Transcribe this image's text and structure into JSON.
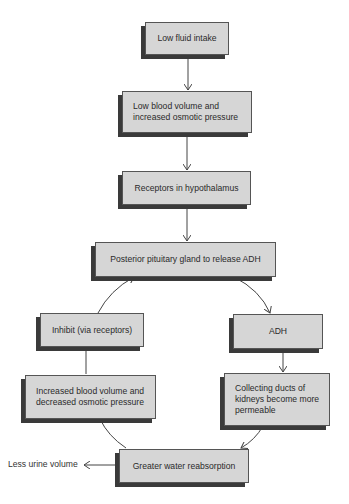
{
  "diagram": {
    "nodes": [
      {
        "id": "low-fluid-intake",
        "label": "Low fluid intake"
      },
      {
        "id": "low-blood-volume",
        "label": "Low blood volume and\nincreased osmotic pressure"
      },
      {
        "id": "receptors-hypothalamus",
        "label": "Receptors in hypothalamus"
      },
      {
        "id": "posterior-pituitary",
        "label": "Posterior pituitary gland to release ADH"
      },
      {
        "id": "inhibit",
        "label": "Inhibit (via receptors)"
      },
      {
        "id": "adh",
        "label": "ADH"
      },
      {
        "id": "increased-blood-volume",
        "label": "Increased blood volume and\ndecreased osmotic pressure"
      },
      {
        "id": "collecting-ducts",
        "label": "Collecting ducts of\nkidneys become more\npermeable"
      },
      {
        "id": "greater-water-reabsorption",
        "label": "Greater water reabsorption"
      }
    ],
    "outputs": {
      "less_urine": "Less urine volume"
    },
    "edges": [
      {
        "from": "low-fluid-intake",
        "to": "low-blood-volume"
      },
      {
        "from": "low-blood-volume",
        "to": "receptors-hypothalamus"
      },
      {
        "from": "receptors-hypothalamus",
        "to": "posterior-pituitary"
      },
      {
        "from": "posterior-pituitary",
        "to": "adh"
      },
      {
        "from": "adh",
        "to": "collecting-ducts"
      },
      {
        "from": "collecting-ducts",
        "to": "greater-water-reabsorption"
      },
      {
        "from": "greater-water-reabsorption",
        "to": "increased-blood-volume"
      },
      {
        "from": "increased-blood-volume",
        "to": "inhibit"
      },
      {
        "from": "inhibit",
        "to": "posterior-pituitary"
      },
      {
        "from": "greater-water-reabsorption",
        "to": "less-urine-volume"
      }
    ],
    "colors": {
      "box_fill": "#d6d6d6",
      "box_shadow": "#3a3a3a",
      "line": "#444444"
    }
  }
}
